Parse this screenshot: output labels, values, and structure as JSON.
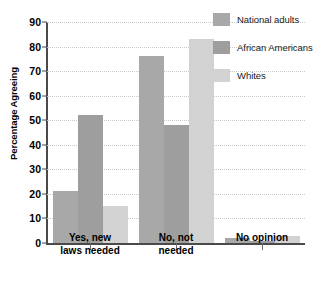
{
  "chart_data": {
    "type": "bar",
    "title": "",
    "subtitle": "",
    "xlabel": "",
    "ylabel": "Percentage Agreeing",
    "ylim": [
      0,
      90
    ],
    "ytick_step": 10,
    "yticks": [
      "0",
      "10",
      "20",
      "30",
      "40",
      "50",
      "60",
      "70",
      "80",
      "90"
    ],
    "grid": true,
    "grid_style": "dotted horizontal",
    "legend_position": "top-right",
    "categories": [
      "Yes, new\nlaws needed",
      "No, not\nneeded",
      "No opinion"
    ],
    "category_labels_flat": [
      "Yes, new laws needed",
      "No, not needed",
      "No opinion"
    ],
    "series": [
      {
        "name": "National adults",
        "color": "#a8a8a8",
        "values": [
          21,
          76,
          2
        ]
      },
      {
        "name": "African Americans",
        "color": "#9e9e9e",
        "values": [
          52,
          48,
          1
        ]
      },
      {
        "name": "Whites",
        "color": "#d2d2d2",
        "values": [
          15,
          83,
          3
        ]
      }
    ],
    "annotations": []
  },
  "axis": {
    "y_title": "Percentage Agreeing",
    "axis_color": "#4a4a4a",
    "grid_color": "#c9c9c9"
  },
  "legend": {
    "items": [
      {
        "label": "National adults",
        "color": "#a8a8a8"
      },
      {
        "label": "African Americans",
        "color": "#9e9e9e"
      },
      {
        "label": "Whites",
        "color": "#d2d2d2"
      }
    ]
  }
}
